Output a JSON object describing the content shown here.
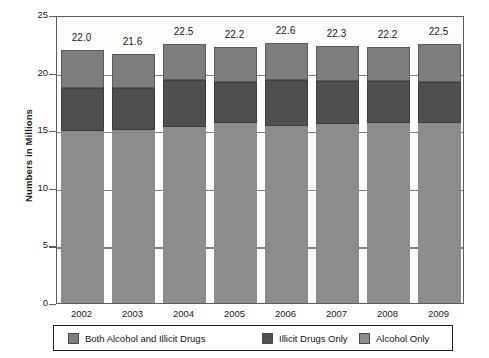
{
  "chart_data": {
    "type": "bar",
    "subtype": "stacked-bar",
    "title": "",
    "xlabel": "",
    "ylabel": "Numbers in Millions",
    "ylim": [
      0,
      25
    ],
    "yticks": [
      0,
      5,
      10,
      15,
      20,
      25
    ],
    "grid": false,
    "legend_position": "bottom",
    "categories": [
      "2002",
      "2003",
      "2004",
      "2005",
      "2006",
      "2007",
      "2008",
      "2009"
    ],
    "series": [
      {
        "name": "Alcohol Only",
        "color": "#8c8c8c",
        "values": [
          14.9,
          15.0,
          15.3,
          15.6,
          15.4,
          15.5,
          15.6,
          15.6
        ]
      },
      {
        "name": "Illicit Drugs Only",
        "color": "#4f4f4f",
        "values": [
          3.8,
          3.7,
          4.1,
          3.6,
          4.0,
          3.8,
          3.7,
          3.6
        ]
      },
      {
        "name": "Both Alcohol and Illicit Drugs",
        "color": "#7d7d7d",
        "values": [
          3.3,
          2.9,
          3.1,
          3.0,
          3.2,
          3.0,
          2.9,
          3.3
        ]
      }
    ],
    "totals": [
      22.0,
      21.6,
      22.5,
      22.2,
      22.6,
      22.3,
      22.2,
      22.5
    ],
    "data_labels": [
      "22.0",
      "21.6",
      "22.5",
      "22.2",
      "22.6",
      "22.3",
      "22.2",
      "22.5"
    ]
  },
  "legend": {
    "items": [
      {
        "label": "Both Alcohol and Illicit Drugs",
        "color": "#7d7d7d"
      },
      {
        "label": "Illicit Drugs Only",
        "color": "#4f4f4f"
      },
      {
        "label": "Alcohol Only",
        "color": "#8c8c8c"
      }
    ]
  }
}
